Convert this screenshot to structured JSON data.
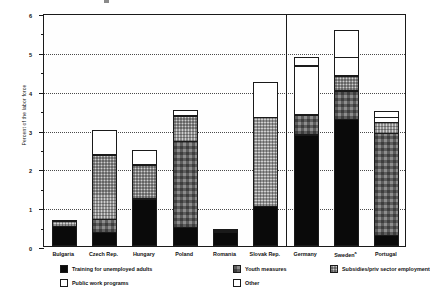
{
  "chart_data": {
    "type": "bar",
    "subtype": "stacked-vertical",
    "title": "",
    "xlabel": "",
    "ylabel": "Percent of the labor force",
    "ylim": [
      0,
      6
    ],
    "yticks": [
      0,
      1,
      2,
      3,
      4,
      5,
      6
    ],
    "ytick_labels": [
      "0",
      "1",
      "2",
      "3",
      "4",
      "5",
      "6"
    ],
    "y_minor_ticks": [
      0.5,
      1.5,
      2.5,
      3.5,
      4.5,
      5.5
    ],
    "grid": "horizontal-dotted",
    "legend_position": "below-axes",
    "group_divider_after_category": "Slovak Rep.",
    "categories": [
      "Bulgaria",
      "Czech Rep.",
      "Hungary",
      "Poland",
      "Romania",
      "Slovak Rep.",
      "Germany",
      "Sweden",
      "Portugal"
    ],
    "category_labels": [
      "Bulgaria",
      "Czech Rep.",
      "Hungary",
      "Poland",
      "Romania",
      "Slovak Rep.",
      "Germany",
      "Swedenᵃ",
      "Portugal"
    ],
    "series": [
      {
        "name": "Training for unemployed adults",
        "key": "training",
        "values": [
          0.52,
          0.35,
          1.22,
          0.48,
          0.37,
          1.03,
          2.87,
          3.27,
          0.28
        ]
      },
      {
        "name": "Youth measures",
        "key": "youth",
        "values": [
          0.0,
          0.36,
          0.0,
          2.24,
          0.0,
          0.0,
          0.53,
          0.75,
          2.65
        ]
      },
      {
        "name": "Subsidies/priv sector employment",
        "key": "subsidies",
        "values": [
          0.14,
          1.68,
          0.89,
          0.67,
          0.04,
          2.3,
          0.0,
          0.4,
          0.29
        ]
      },
      {
        "name": "Public work programs",
        "key": "publicwork",
        "values": [
          0.0,
          0.66,
          0.4,
          0.0,
          0.0,
          0.94,
          1.28,
          0.5,
          0.16
        ]
      },
      {
        "name": "Other",
        "key": "other",
        "values": [
          0.02,
          0.0,
          0.0,
          0.16,
          0.02,
          0.0,
          0.24,
          0.71,
          0.17
        ]
      }
    ],
    "totals": [
      0.68,
      3.05,
      2.51,
      3.55,
      0.43,
      4.27,
      4.92,
      5.63,
      3.55
    ]
  },
  "legend": {
    "items": [
      {
        "label": "Training for unemployed adults",
        "key": "training",
        "swatch": "solid-black"
      },
      {
        "label": "Youth measures",
        "key": "youth",
        "swatch": "dark-gray-hatch"
      },
      {
        "label": "Subsidies/priv sector employment",
        "key": "subsidies",
        "swatch": "light-gray-hatch"
      },
      {
        "label": "Public work programs",
        "key": "publicwork",
        "swatch": "white-outline"
      },
      {
        "label": "Other",
        "key": "other",
        "swatch": "white-outline"
      }
    ]
  },
  "colors": {
    "training": "#0a0a0a",
    "youth": "#8d8d8d",
    "subsidies": "#cfcfcf",
    "publicwork": "#ffffff",
    "other": "#ffffff",
    "axis": "#1a1a1a",
    "grid": "#4a4a4a",
    "background": "#ffffff"
  }
}
